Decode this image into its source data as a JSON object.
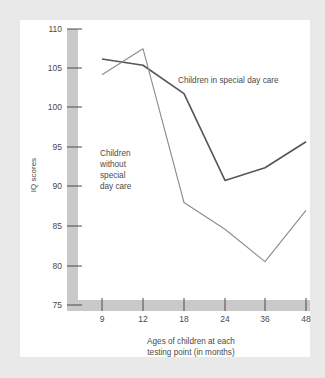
{
  "page": {
    "background_color": "#e9e9e9",
    "panel_color": "#ffffff"
  },
  "chart_data": {
    "type": "line",
    "title": "",
    "xlabel_line1": "Ages of children at each",
    "xlabel_line2": "testing point (in months)",
    "ylabel": "IQ scores",
    "categories": [
      "9",
      "12",
      "18",
      "24",
      "36",
      "48"
    ],
    "x": [
      9,
      12,
      18,
      24,
      36,
      48
    ],
    "xtick_labels": [
      "9",
      "12",
      "18",
      "24",
      "36",
      "48"
    ],
    "ytick_labels": [
      "75",
      "80",
      "85",
      "90",
      "95",
      "100",
      "105",
      "110"
    ],
    "yticks": [
      75,
      80,
      85,
      90,
      95,
      100,
      105,
      110
    ],
    "ylim": [
      75,
      110
    ],
    "grid": false,
    "legend_position": "inline-annotations",
    "series": [
      {
        "name": "Children in special day care",
        "label": "Children in special day care",
        "color": "#55555a",
        "values": [
          106.2,
          105.4,
          101.8,
          90.8,
          92.4,
          95.7
        ]
      },
      {
        "name": "Children without special day care",
        "label_lines": [
          "Children",
          "without",
          "special",
          "day care"
        ],
        "label": "Children without special day care",
        "color": "#8b8b90",
        "values": [
          104.2,
          107.5,
          88.0,
          84.6,
          80.5,
          87.0
        ]
      }
    ],
    "axis_band_color": "#c9c9c9",
    "annotations": [
      {
        "text": "Children in special day care",
        "series": "Children in special day care"
      },
      {
        "text": "Children without special day care",
        "series": "Children without special day care"
      }
    ]
  }
}
